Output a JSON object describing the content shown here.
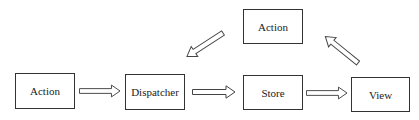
{
  "diagram": {
    "nodes": [
      {
        "id": "action_left",
        "label": "Action"
      },
      {
        "id": "dispatcher",
        "label": "Dispatcher"
      },
      {
        "id": "store",
        "label": "Store"
      },
      {
        "id": "view",
        "label": "View"
      },
      {
        "id": "action_top",
        "label": "Action"
      }
    ],
    "edges": [
      {
        "from": "action_left",
        "to": "dispatcher"
      },
      {
        "from": "dispatcher",
        "to": "store"
      },
      {
        "from": "store",
        "to": "view"
      },
      {
        "from": "view",
        "to": "action_top"
      },
      {
        "from": "action_top",
        "to": "dispatcher"
      }
    ],
    "colors": {
      "stroke": "#333333",
      "fill": "#ffffff"
    }
  }
}
